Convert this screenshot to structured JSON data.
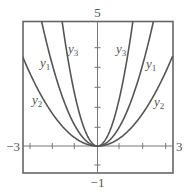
{
  "chart_data": {
    "type": "line",
    "title": "",
    "xlabel": "",
    "ylabel": "",
    "xlim": [
      -3,
      3
    ],
    "ylim": [
      -1,
      5
    ],
    "grid": false,
    "legend": "inline labels",
    "axis_labels": {
      "x_min": "−3",
      "x_max": "3",
      "y_max": "5",
      "y_min": "−1"
    },
    "series": [
      {
        "name": "y1",
        "label_base": "y",
        "label_sub": "1",
        "formula": "y = x^2 (approx.)",
        "coef": 1.0,
        "x": [
          -2.24,
          -2,
          -1,
          0,
          1,
          2,
          2.24
        ],
        "y": [
          5,
          4,
          1,
          0,
          1,
          4,
          5
        ]
      },
      {
        "name": "y2",
        "label_base": "y",
        "label_sub": "2",
        "formula": "y ≈ 0.4x^2",
        "coef": 0.4,
        "x": [
          -3,
          -2,
          -1,
          0,
          1,
          2,
          3
        ],
        "y": [
          3.6,
          1.6,
          0.4,
          0,
          0.4,
          1.6,
          3.6
        ]
      },
      {
        "name": "y3",
        "label_base": "y",
        "label_sub": "3",
        "formula": "y ≈ 2.5x^2",
        "coef": 2.5,
        "x": [
          -1.41,
          -1,
          0,
          1,
          1.41
        ],
        "y": [
          5,
          2.5,
          0,
          2.5,
          5
        ]
      }
    ],
    "line_color": "#555555"
  }
}
